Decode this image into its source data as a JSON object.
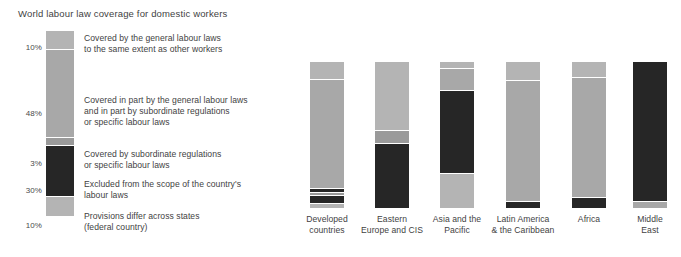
{
  "chart_data": {
    "type": "bar",
    "title": "World labour law coverage for domestic workers",
    "xlabel": "",
    "ylabel": "",
    "ylim": [
      0,
      100
    ],
    "grid": false,
    "legend_position": "left",
    "stacked": true,
    "units": "percent",
    "categories": [
      "Developed\ncountries",
      "Eastern\nEurope and CIS",
      "Asia and the\nPacific",
      "Latin America\n& the Caribbean",
      "Africa",
      "Middle\nEast"
    ],
    "series": [
      {
        "name": "Covered by the general labour laws\nto the same extent as other workers",
        "short_name": "covered-general",
        "color": "#b4b4b4",
        "legend_pct": "10%",
        "legend_value": 10,
        "values": [
          12,
          0,
          5,
          13,
          11,
          0
        ]
      },
      {
        "name": "Covered in part by the general labour laws\nand in part by subordinate regulations\nor specific labour laws",
        "short_name": "covered-in-part",
        "color": "#a8a8a8",
        "legend_pct": "48%",
        "legend_value": 48,
        "values": [
          75,
          47,
          15,
          83,
          82,
          4
        ]
      },
      {
        "name": "Covered by subordinate regulations\nor specific labour laws",
        "short_name": "covered-subordinate",
        "color": "#9a9a9a",
        "legend_pct": "3%",
        "legend_value": 3,
        "values": [
          3,
          9,
          0,
          0,
          0,
          0
        ]
      },
      {
        "name": "Excluded from the scope of the country's\nlabour laws",
        "short_name": "excluded",
        "color": "#262626",
        "legend_pct": "30%",
        "legend_value": 30,
        "values": [
          5,
          44,
          57,
          4,
          7,
          96
        ]
      },
      {
        "name": "Provisions differ across states\n(federal country)",
        "short_name": "provisions-differ",
        "color": "#b4b4b4",
        "legend_pct": "10%",
        "legend_value": 10,
        "values": [
          5,
          0,
          23,
          0,
          0,
          0
        ]
      }
    ]
  },
  "legend": {
    "items": [
      {
        "pct": "10%",
        "label": "Covered by the general labour laws\nto the same extent as other workers",
        "color": "#b4b4b4",
        "bar_height_pct": 10
      },
      {
        "pct": "48%",
        "label": "Covered in part by the general labour laws\nand in part by subordinate regulations\nor specific labour laws",
        "color": "#a8a8a8",
        "bar_height_pct": 48
      },
      {
        "pct": "3%",
        "label": "Covered by subordinate regulations\nor specific labour laws",
        "color": "#9a9a9a",
        "bar_height_pct": 4
      },
      {
        "pct": "30%",
        "label": "Excluded from the scope of the country's\nlabour laws",
        "color": "#262626",
        "bar_height_pct": 28
      },
      {
        "pct": "10%",
        "label": "Provisions differ across states\n(federal country)",
        "color": "#b4b4b4",
        "bar_height_pct": 10
      }
    ]
  },
  "bars": [
    {
      "caption": "Developed\ncountries",
      "segments": [
        {
          "color": "#b4b4b4",
          "pct": 12
        },
        {
          "color": "#a8a8a8",
          "pct": 75
        },
        {
          "color": "#262626",
          "pct": 3
        },
        {
          "color": "#9a9a9a",
          "pct": 2
        },
        {
          "color": "#262626",
          "pct": 5
        },
        {
          "color": "#b4b4b4",
          "pct": 3
        }
      ]
    },
    {
      "caption": "Eastern\nEurope and CIS",
      "segments": [
        {
          "color": "#b4b4b4",
          "pct": 47
        },
        {
          "color": "#9a9a9a",
          "pct": 9
        },
        {
          "color": "#262626",
          "pct": 44
        }
      ]
    },
    {
      "caption": "Asia and the\nPacific",
      "segments": [
        {
          "color": "#b4b4b4",
          "pct": 5
        },
        {
          "color": "#a8a8a8",
          "pct": 15
        },
        {
          "color": "#262626",
          "pct": 57
        },
        {
          "color": "#b4b4b4",
          "pct": 23
        }
      ]
    },
    {
      "caption": "Latin America\n& the Caribbean",
      "segments": [
        {
          "color": "#b4b4b4",
          "pct": 13
        },
        {
          "color": "#a8a8a8",
          "pct": 83
        },
        {
          "color": "#262626",
          "pct": 4
        }
      ]
    },
    {
      "caption": "Africa",
      "segments": [
        {
          "color": "#b4b4b4",
          "pct": 11
        },
        {
          "color": "#a8a8a8",
          "pct": 82
        },
        {
          "color": "#262626",
          "pct": 7
        }
      ]
    },
    {
      "caption": "Middle\nEast",
      "segments": [
        {
          "color": "#262626",
          "pct": 96
        },
        {
          "color": "#a8a8a8",
          "pct": 4
        }
      ]
    }
  ]
}
